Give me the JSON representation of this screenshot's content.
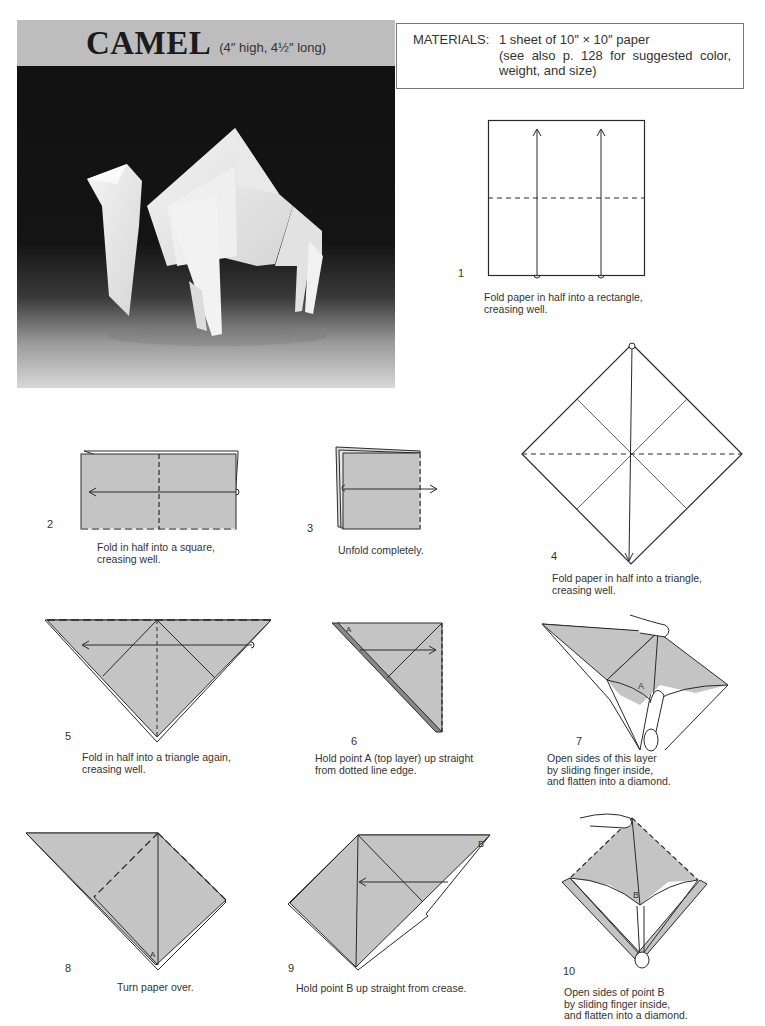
{
  "header": {
    "title": "CAMEL",
    "dimensions": "(4″ high, 4½″ long)",
    "band_color": "#bdbdbd"
  },
  "photo": {
    "subject": "Folded white paper camel on dark gradient background"
  },
  "materials": {
    "label": "MATERIALS:",
    "line1": "1 sheet of 10″ × 10″ paper",
    "line2": "(see also p. 128 for suggested color, weight, and size)"
  },
  "colors": {
    "paper_fill": "#c4c4c4",
    "line": "#2a2a2a",
    "paper_white": "#ffffff"
  },
  "steps": [
    {
      "number": "1",
      "caption": [
        "Fold paper in half into a rectangle,",
        "creasing well."
      ]
    },
    {
      "number": "2",
      "caption": [
        "Fold in half into a square,",
        "creasing well."
      ]
    },
    {
      "number": "3",
      "caption": [
        "Unfold completely."
      ]
    },
    {
      "number": "4",
      "caption": [
        "Fold paper in half into a triangle,",
        "creasing well."
      ]
    },
    {
      "number": "5",
      "caption": [
        "Fold in half into a triangle again,",
        "creasing well."
      ]
    },
    {
      "number": "6",
      "caption": [
        "Hold point A (top layer) up straight",
        "from dotted line edge."
      ],
      "point_label": "A"
    },
    {
      "number": "7",
      "caption": [
        "Open sides of this layer",
        "by sliding finger inside,",
        "and flatten into a diamond."
      ],
      "point_label": "A"
    },
    {
      "number": "8",
      "caption": [
        "Turn paper over."
      ],
      "point_label": "A"
    },
    {
      "number": "9",
      "caption": [
        "Hold point B up straight from crease."
      ],
      "point_label": "B"
    },
    {
      "number": "10",
      "caption": [
        "Open sides of point B",
        "by sliding finger inside,",
        "and flatten into a diamond."
      ],
      "point_label": "B"
    }
  ]
}
